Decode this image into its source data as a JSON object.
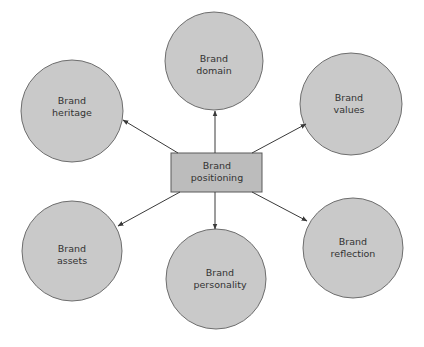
{
  "diagram": {
    "type": "hub-and-spoke",
    "colors": {
      "circle_fill": "#c9c9c9",
      "circle_stroke": "#6e6e6e",
      "rect_fill": "#bcbcbc",
      "rect_stroke": "#5a5a5a",
      "arrow": "#3a3a3a",
      "text": "#333333"
    },
    "center": {
      "line1": "Brand",
      "line2": "positioning"
    },
    "nodes": [
      {
        "id": "heritage",
        "line1": "Brand",
        "line2": "heritage"
      },
      {
        "id": "domain",
        "line1": "Brand",
        "line2": "domain"
      },
      {
        "id": "values",
        "line1": "Brand",
        "line2": "values"
      },
      {
        "id": "assets",
        "line1": "Brand",
        "line2": "assets"
      },
      {
        "id": "personality",
        "line1": "Brand",
        "line2": "personality"
      },
      {
        "id": "reflection",
        "line1": "Brand",
        "line2": "reflection"
      }
    ],
    "edges": [
      {
        "from": "positioning",
        "to": "heritage"
      },
      {
        "from": "positioning",
        "to": "domain"
      },
      {
        "from": "positioning",
        "to": "values"
      },
      {
        "from": "positioning",
        "to": "assets"
      },
      {
        "from": "positioning",
        "to": "personality"
      },
      {
        "from": "positioning",
        "to": "reflection"
      }
    ]
  }
}
